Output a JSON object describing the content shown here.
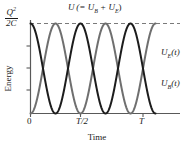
{
  "figure": {
    "axes": {
      "y_title": "Energy",
      "x_title": "Time",
      "y_max_label": {
        "numerator": "Q",
        "numerator_exponent": "2",
        "denominator": "2C"
      },
      "x_ticks": [
        {
          "label": "0",
          "value": 0
        },
        {
          "label": "T/2",
          "value": 0.5
        },
        {
          "label": "T",
          "value": 1.0
        }
      ],
      "y_tick_count": 3
    },
    "annotations": {
      "total_energy": {
        "symbol": "U",
        "expression": "(= U",
        "sub_b": "B",
        "plus": " + U",
        "sub_e": "E",
        "close": ")"
      },
      "curve_ue": {
        "symbol": "U",
        "sub": "E",
        "arg": "(t)"
      },
      "curve_ub": {
        "symbol": "U",
        "sub": "B",
        "arg": "(t)"
      }
    },
    "style": {
      "curve_ue_color": "#1c1c1c",
      "curve_ub_color": "#6f6f6f",
      "axis_color": "#595959",
      "dashed_line_color": "#7a7a7a",
      "background": "#ffffff"
    }
  },
  "chart_data": {
    "type": "line",
    "title": "",
    "xlabel": "Time",
    "ylabel": "Energy",
    "xlim": [
      0,
      2.5
    ],
    "ylim": [
      0,
      1
    ],
    "grid": false,
    "legend": "inline-right",
    "axis_tick_labels": {
      "x": [
        "0",
        "T/2",
        "T"
      ],
      "x_positions": [
        0,
        1,
        2
      ],
      "y_top": "Q^2/2C"
    },
    "annotations": [
      {
        "text": "U (= U_B + U_E)",
        "x": 1.0,
        "y": 1.05,
        "kind": "dashed-constant-sum"
      },
      {
        "text": "U_E(t)",
        "x": 2.6,
        "y": 0.72,
        "kind": "series-label"
      },
      {
        "text": "U_B(t)",
        "x": 2.6,
        "y": 0.34,
        "kind": "series-label"
      }
    ],
    "series": [
      {
        "name": "U_E(t)",
        "formula": "U_E(t) = (Q^2/2C) * cos^2(2*pi*t/T)",
        "color": "#1c1c1c",
        "linewidth": 2.0,
        "x": [
          0,
          0.125,
          0.25,
          0.375,
          0.5,
          0.625,
          0.75,
          0.875,
          1.0,
          1.125,
          1.25,
          1.375,
          1.5,
          1.625,
          1.75,
          1.875,
          2.0,
          2.125,
          2.25,
          2.375,
          2.5
        ],
        "values": [
          1.0,
          0.5,
          0.0,
          0.5,
          1.0,
          0.5,
          0.0,
          0.5,
          1.0,
          0.5,
          0.0,
          0.5,
          1.0,
          0.5,
          0.0,
          0.5,
          1.0,
          0.5,
          0.0,
          0.5,
          1.0
        ]
      },
      {
        "name": "U_B(t)",
        "formula": "U_B(t) = (Q^2/2C) * sin^2(2*pi*t/T)",
        "color": "#6f6f6f",
        "linewidth": 2.0,
        "x": [
          0,
          0.125,
          0.25,
          0.375,
          0.5,
          0.625,
          0.75,
          0.875,
          1.0,
          1.125,
          1.25,
          1.375,
          1.5,
          1.625,
          1.75,
          1.875,
          2.0,
          2.125,
          2.25,
          2.375,
          2.5
        ],
        "values": [
          0.0,
          0.5,
          1.0,
          0.5,
          0.0,
          0.5,
          1.0,
          0.5,
          0.0,
          0.5,
          1.0,
          0.5,
          0.0,
          0.5,
          1.0,
          0.5,
          0.0,
          0.5,
          1.0,
          0.5,
          0.0
        ]
      },
      {
        "name": "U (total)",
        "formula": "U = U_B + U_E = Q^2/2C",
        "color": "#7a7a7a",
        "linestyle": "dashed",
        "x": [
          0,
          2.5
        ],
        "values": [
          1.0,
          1.0
        ]
      }
    ]
  }
}
